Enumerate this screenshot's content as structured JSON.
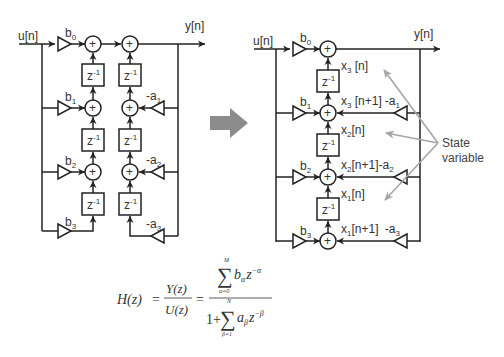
{
  "left_diagram": {
    "input_label": "u[n]",
    "output_label": "y[n]",
    "feedforward_gains": [
      "b",
      "b",
      "b",
      "b"
    ],
    "feedforward_subs": [
      "0",
      "1",
      "2",
      "3"
    ],
    "feedback_gains": [
      "-a",
      "-a",
      "-a"
    ],
    "feedback_subs": [
      "1",
      "2",
      "3"
    ],
    "delay_label": "z",
    "delay_exp": "-1",
    "adder_symbol": "+"
  },
  "transform_arrow": {
    "color": "#8c8c8c",
    "icon": "right-arrow-icon"
  },
  "right_diagram": {
    "input_label": "u[n]",
    "output_label": "y[n]",
    "feedforward_gains": [
      "b",
      "b",
      "b",
      "b"
    ],
    "feedforward_subs": [
      "0",
      "1",
      "2",
      "3"
    ],
    "feedback_gains": [
      "-a",
      "-a",
      "-a"
    ],
    "feedback_subs": [
      "1",
      "2",
      "3"
    ],
    "delay_label": "z",
    "delay_exp": "-1",
    "adder_symbol": "+",
    "state_labels": [
      {
        "base": "x",
        "sub": "3",
        "rest": " [n]"
      },
      {
        "base": "x",
        "sub": "3",
        "rest": " [n+1]"
      },
      {
        "base": "x",
        "sub": "2",
        "rest": "[n]"
      },
      {
        "base": "x",
        "sub": "2",
        "rest": "[n+1]"
      },
      {
        "base": "x",
        "sub": "1",
        "rest": "[n]"
      },
      {
        "base": "x",
        "sub": "1",
        "rest": "[n+1] "
      }
    ],
    "annotation": {
      "line1": "State",
      "line2": "variable",
      "color": "#a6a6a6"
    }
  },
  "formula": {
    "lhs": "H(z)",
    "eq": "=",
    "ratio_num": "Y(z)",
    "ratio_den": "U(z)",
    "sum_symbol": "∑",
    "num_upper": "M",
    "num_lower": "α=0",
    "num_term_base": "b",
    "num_term_sub": "α",
    "num_term_z": "z",
    "num_term_exp": "−α",
    "den_one": "1+",
    "den_upper": "N",
    "den_lower": "β=1",
    "den_term_base": "a",
    "den_term_sub": "β",
    "den_term_z": "z",
    "den_term_exp": "−β"
  }
}
